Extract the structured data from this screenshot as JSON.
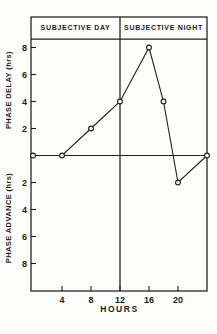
{
  "chart_data": {
    "type": "line",
    "x": [
      0,
      4,
      8,
      12,
      16,
      18,
      20,
      24
    ],
    "y": [
      0,
      0,
      2,
      4,
      8,
      4,
      -2,
      0
    ],
    "xlabel": "HOURS",
    "ylabel_delay": "PHASE DELAY (hrs)",
    "ylabel_advance": "PHASE ADVANCE (hrs)",
    "annotations": [
      "SUBJECTIVE DAY",
      "SUBJECTIVE NIGHT"
    ],
    "divider_x": 12,
    "x_ticks": [
      4,
      8,
      12,
      16,
      20
    ],
    "y_ticks_delay": [
      2,
      4,
      6,
      8
    ],
    "y_ticks_advance": [
      2,
      4,
      6,
      8
    ],
    "xlim": [
      0,
      24
    ],
    "ylim": [
      -10,
      8.7
    ],
    "marker": "open-circle",
    "grid": false,
    "legend": "none",
    "colors": {
      "line": "#1e1e1e",
      "background": "#fdfdfb"
    }
  }
}
